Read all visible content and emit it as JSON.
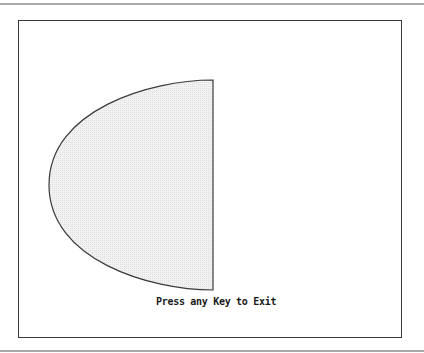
{
  "screen": {
    "prompt_text": "Press any Key to Exit"
  },
  "shape": {
    "type": "half-ellipse",
    "fill_color": "#ebebeb",
    "stroke_color": "#3a3a3a"
  }
}
